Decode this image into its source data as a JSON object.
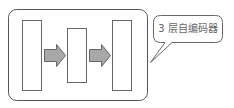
{
  "diagram": {
    "callout": {
      "text": "3 层自编码器"
    },
    "layers": [
      {
        "name": "input-layer"
      },
      {
        "name": "hidden-layer"
      },
      {
        "name": "output-layer"
      }
    ],
    "colors": {
      "stroke": "#555555",
      "arrow_fill": "#a8a8a8",
      "arrow_stroke": "#666666",
      "background": "#ffffff",
      "text": "#666666"
    }
  }
}
